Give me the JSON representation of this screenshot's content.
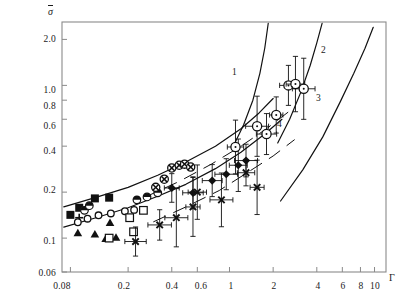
{
  "figure": {
    "background_color": "#ffffff",
    "frame_color": "#8a8a8a",
    "data_color": "#111111",
    "width": 404,
    "height": 303
  },
  "axes": {
    "y_title": "σ",
    "y_title_overbar": true,
    "x_title": "Γ",
    "y_ticks": [
      "2.0",
      "1.0",
      "0.8",
      "0.6",
      "0.4",
      "0.2",
      "0.1",
      "0.06"
    ],
    "x_ticks": [
      "0.08",
      "0.2",
      "0.4",
      "0.6",
      "1",
      "2",
      "4",
      "6",
      "8",
      "10"
    ]
  },
  "curve_labels": [
    {
      "text": "1"
    },
    {
      "text": "2"
    },
    {
      "text": "3"
    },
    {
      "text": "4"
    }
  ],
  "chart_data": {
    "type": "scatter",
    "title": "",
    "xlabel": "Γ",
    "ylabel": "σ̄",
    "xscale": "log",
    "yscale": "log",
    "xlim": [
      0.07,
      12.0
    ],
    "ylim": [
      0.06,
      2.6
    ],
    "grid": false,
    "legend": "none",
    "x_tick_values": [
      0.08,
      0.2,
      0.4,
      0.6,
      1,
      2,
      4,
      6,
      8,
      10
    ],
    "y_tick_values": [
      2.0,
      1.0,
      0.8,
      0.6,
      0.4,
      0.2,
      0.1,
      0.06
    ],
    "annotations": [
      {
        "text": "1",
        "x": 1.05,
        "y": 0.86
      },
      {
        "text": "2",
        "x": 3.05,
        "y": 1.45
      },
      {
        "text": "3",
        "x": 2.85,
        "y": 0.62
      },
      {
        "text": "4",
        "x": 1.85,
        "y": 0.39
      }
    ],
    "series": [
      {
        "name": "filled-square",
        "marker": "filled-square",
        "points": [
          {
            "x": 0.08,
            "y": 0.142
          },
          {
            "x": 0.092,
            "y": 0.158
          },
          {
            "x": 0.118,
            "y": 0.182
          },
          {
            "x": 0.148,
            "y": 0.184
          }
        ]
      },
      {
        "name": "half-filled-circle",
        "marker": "half-filled-circle",
        "points": [
          {
            "x": 0.1,
            "y": 0.152
          },
          {
            "x": 0.108,
            "y": 0.163
          },
          {
            "x": 0.23,
            "y": 0.178
          },
          {
            "x": 0.27,
            "y": 0.186
          },
          {
            "x": 0.32,
            "y": 0.198
          }
        ]
      },
      {
        "name": "plus",
        "marker": "plus",
        "points": [
          {
            "x": 0.092,
            "y": 0.136
          }
        ]
      },
      {
        "name": "open-circle-small",
        "marker": "open-circle",
        "points": [
          {
            "x": 0.09,
            "y": 0.127
          },
          {
            "x": 0.105,
            "y": 0.134
          },
          {
            "x": 0.125,
            "y": 0.141
          },
          {
            "x": 0.152,
            "y": 0.145
          },
          {
            "x": 0.19,
            "y": 0.15
          },
          {
            "x": 0.22,
            "y": 0.153
          }
        ]
      },
      {
        "name": "filled-triangle",
        "marker": "filled-triangle",
        "points": [
          {
            "x": 0.09,
            "y": 0.108
          },
          {
            "x": 0.118,
            "y": 0.106
          },
          {
            "x": 0.14,
            "y": 0.099
          },
          {
            "x": 0.15,
            "y": 0.126
          },
          {
            "x": 0.165,
            "y": 0.101
          }
        ]
      },
      {
        "name": "open-square",
        "marker": "open-square",
        "points": [
          {
            "x": 0.148,
            "y": 0.1
          },
          {
            "x": 0.205,
            "y": 0.136
          },
          {
            "x": 0.218,
            "y": 0.11
          },
          {
            "x": 0.255,
            "y": 0.152
          }
        ]
      },
      {
        "name": "crossed-circle",
        "marker": "crossed-circle",
        "points": [
          {
            "x": 0.31,
            "y": 0.215
          },
          {
            "x": 0.355,
            "y": 0.243
          },
          {
            "x": 0.4,
            "y": 0.288
          },
          {
            "x": 0.45,
            "y": 0.3
          },
          {
            "x": 0.49,
            "y": 0.305
          },
          {
            "x": 0.54,
            "y": 0.292
          }
        ]
      },
      {
        "name": "filled-diamond",
        "marker": "filled-diamond",
        "points": [
          {
            "x": 0.4,
            "y": 0.213
          },
          {
            "x": 0.56,
            "y": 0.198
          },
          {
            "x": 0.76,
            "y": 0.238
          },
          {
            "x": 0.95,
            "y": 0.262
          },
          {
            "x": 1.15,
            "y": 0.3
          },
          {
            "x": 1.3,
            "y": 0.322
          }
        ],
        "error_bars": true
      },
      {
        "name": "cross-x",
        "marker": "cross-x",
        "points": [
          {
            "x": 0.225,
            "y": 0.095
          },
          {
            "x": 0.33,
            "y": 0.122
          },
          {
            "x": 0.43,
            "y": 0.136
          },
          {
            "x": 0.56,
            "y": 0.16
          },
          {
            "x": 0.6,
            "y": 0.2
          },
          {
            "x": 0.88,
            "y": 0.178
          },
          {
            "x": 1.3,
            "y": 0.268
          },
          {
            "x": 1.55,
            "y": 0.215
          }
        ],
        "error_bars": true
      },
      {
        "name": "open-circle-large",
        "marker": "open-circle-large",
        "points": [
          {
            "x": 1.1,
            "y": 0.395
          },
          {
            "x": 1.55,
            "y": 0.54
          },
          {
            "x": 1.8,
            "y": 0.48
          },
          {
            "x": 2.1,
            "y": 0.64
          },
          {
            "x": 2.55,
            "y": 1.0
          },
          {
            "x": 2.85,
            "y": 1.02
          },
          {
            "x": 3.25,
            "y": 0.95
          }
        ],
        "error_bars": true
      }
    ],
    "curves": [
      {
        "name": "curve-1",
        "label": "1",
        "style": "solid",
        "points": [
          [
            1.05,
            0.39
          ],
          [
            1.25,
            0.55
          ],
          [
            1.45,
            0.8
          ],
          [
            1.62,
            1.2
          ],
          [
            1.75,
            1.75
          ],
          [
            1.85,
            2.55
          ]
        ]
      },
      {
        "name": "curve-2",
        "label": "2",
        "style": "solid",
        "points": [
          [
            2.15,
            0.42
          ],
          [
            2.6,
            0.6
          ],
          [
            3.1,
            0.9
          ],
          [
            3.6,
            1.35
          ],
          [
            4.0,
            1.9
          ],
          [
            4.35,
            2.55
          ]
        ]
      },
      {
        "name": "curve-3",
        "label": "3",
        "style": "solid",
        "points": [
          [
            2.25,
            0.175
          ],
          [
            3.2,
            0.28
          ],
          [
            4.4,
            0.46
          ],
          [
            5.8,
            0.78
          ],
          [
            7.2,
            1.2
          ],
          [
            8.6,
            1.75
          ],
          [
            9.8,
            2.4
          ]
        ]
      },
      {
        "name": "envelope-upper",
        "label": "",
        "style": "solid",
        "points": [
          [
            0.072,
            0.16
          ],
          [
            0.12,
            0.185
          ],
          [
            0.2,
            0.215
          ],
          [
            0.32,
            0.258
          ],
          [
            0.5,
            0.315
          ],
          [
            0.8,
            0.4
          ],
          [
            1.2,
            0.52
          ],
          [
            1.6,
            0.66
          ],
          [
            2.0,
            0.82
          ]
        ]
      },
      {
        "name": "envelope-lower",
        "label": "",
        "style": "solid",
        "points": [
          [
            0.072,
            0.118
          ],
          [
            0.12,
            0.136
          ],
          [
            0.2,
            0.158
          ],
          [
            0.32,
            0.188
          ],
          [
            0.5,
            0.225
          ],
          [
            0.8,
            0.285
          ],
          [
            1.2,
            0.365
          ],
          [
            1.75,
            0.48
          ],
          [
            2.3,
            0.6
          ]
        ]
      },
      {
        "name": "dashed-band-upper",
        "label": "",
        "style": "dashed",
        "points": [
          [
            0.26,
            0.185
          ],
          [
            0.45,
            0.235
          ],
          [
            0.75,
            0.305
          ],
          [
            1.2,
            0.4
          ],
          [
            1.8,
            0.52
          ],
          [
            2.6,
            0.68
          ]
        ]
      },
      {
        "name": "dashed-band-lower",
        "label": "",
        "style": "dashed",
        "points": [
          [
            0.3,
            0.128
          ],
          [
            0.5,
            0.16
          ],
          [
            0.85,
            0.205
          ],
          [
            1.3,
            0.265
          ],
          [
            2.0,
            0.345
          ],
          [
            2.8,
            0.44
          ]
        ]
      }
    ]
  }
}
